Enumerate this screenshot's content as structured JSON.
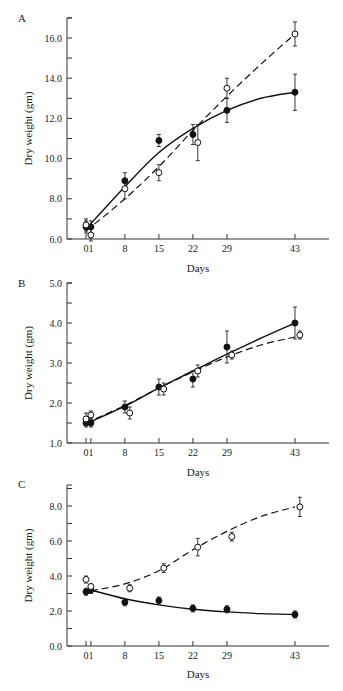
{
  "chart_data": [
    {
      "panel": "A",
      "type": "line",
      "xlabel": "Days",
      "ylabel": "Dry weight (gm)",
      "x_ticks": [
        "0",
        "1",
        "8",
        "15",
        "22",
        "29",
        "43"
      ],
      "y_ticks": [
        "6.0",
        "8.0",
        "10.0",
        "12.0",
        "14.0",
        "16.0"
      ],
      "ylim": [
        6.0,
        17.0
      ],
      "series": [
        {
          "name": "filled",
          "marker": "filled-circle",
          "line": "solid",
          "x": [
            0,
            1,
            8,
            15,
            22,
            29,
            43
          ],
          "y": [
            6.6,
            6.6,
            8.9,
            10.9,
            11.2,
            12.4,
            13.3
          ],
          "err": [
            0.3,
            0.3,
            0.4,
            0.3,
            0.5,
            0.6,
            0.9
          ],
          "fit": [
            [
              0,
              6.5
            ],
            [
              8,
              8.6
            ],
            [
              15,
              10.3
            ],
            [
              22,
              11.5
            ],
            [
              29,
              12.4
            ],
            [
              36,
              13.0
            ],
            [
              43,
              13.3
            ]
          ]
        },
        {
          "name": "open",
          "marker": "open-circle",
          "line": "dashed",
          "x": [
            0,
            1,
            8,
            15,
            23,
            29,
            43
          ],
          "y": [
            6.7,
            6.2,
            8.5,
            9.3,
            10.8,
            13.5,
            16.2
          ],
          "err": [
            0.3,
            0.3,
            0.5,
            0.4,
            0.9,
            0.5,
            0.6
          ],
          "fit": [
            [
              0,
              6.4
            ],
            [
              8,
              8.0
            ],
            [
              15,
              9.6
            ],
            [
              22,
              11.4
            ],
            [
              29,
              13.1
            ],
            [
              36,
              14.7
            ],
            [
              43,
              16.2
            ]
          ]
        }
      ]
    },
    {
      "panel": "B",
      "type": "line",
      "xlabel": "Days",
      "ylabel": "Dry weight (gm)",
      "x_ticks": [
        "0",
        "1",
        "8",
        "15",
        "22",
        "29",
        "43"
      ],
      "y_ticks": [
        "1.0",
        "2.0",
        "3.0",
        "4.0",
        "5.0"
      ],
      "ylim": [
        1.0,
        5.0
      ],
      "series": [
        {
          "name": "filled",
          "marker": "filled-circle",
          "line": "solid",
          "x": [
            0,
            1,
            8,
            15,
            22,
            29,
            43
          ],
          "y": [
            1.5,
            1.5,
            1.9,
            2.4,
            2.6,
            3.4,
            4.0
          ],
          "err": [
            0.1,
            0.1,
            0.15,
            0.2,
            0.2,
            0.4,
            0.4
          ],
          "fit": [
            [
              0,
              1.48
            ],
            [
              8,
              1.92
            ],
            [
              15,
              2.38
            ],
            [
              22,
              2.8
            ],
            [
              29,
              3.22
            ],
            [
              36,
              3.62
            ],
            [
              43,
              4.0
            ]
          ]
        },
        {
          "name": "open",
          "marker": "open-circle",
          "line": "dashed",
          "x": [
            0,
            1,
            9,
            16,
            23,
            30,
            44
          ],
          "y": [
            1.6,
            1.7,
            1.75,
            2.35,
            2.8,
            3.2,
            3.7
          ],
          "err": [
            0.15,
            0.1,
            0.15,
            0.15,
            0.15,
            0.1,
            0.1
          ],
          "fit": [
            [
              0,
              1.5
            ],
            [
              8,
              1.94
            ],
            [
              15,
              2.37
            ],
            [
              22,
              2.78
            ],
            [
              29,
              3.15
            ],
            [
              36,
              3.45
            ],
            [
              43,
              3.65
            ]
          ]
        }
      ]
    },
    {
      "panel": "C",
      "type": "line",
      "xlabel": "Days",
      "ylabel": "Dry weight (gm)",
      "x_ticks": [
        "0",
        "1",
        "8",
        "15",
        "22",
        "29",
        "43"
      ],
      "y_ticks": [
        "0.0",
        "2.0",
        "4.0",
        "6.0",
        "8.0"
      ],
      "ylim": [
        0.0,
        9.0
      ],
      "series": [
        {
          "name": "filled",
          "marker": "filled-circle",
          "line": "solid",
          "x": [
            0,
            1,
            8,
            15,
            22,
            29,
            43
          ],
          "y": [
            3.1,
            3.2,
            2.5,
            2.6,
            2.15,
            2.1,
            1.8
          ],
          "err": [
            0.2,
            0.2,
            0.2,
            0.2,
            0.2,
            0.2,
            0.2
          ],
          "fit": [
            [
              1,
              3.2
            ],
            [
              8,
              2.7
            ],
            [
              15,
              2.35
            ],
            [
              22,
              2.1
            ],
            [
              29,
              1.95
            ],
            [
              36,
              1.85
            ],
            [
              43,
              1.8
            ]
          ]
        },
        {
          "name": "open",
          "marker": "open-circle",
          "line": "dashed",
          "x": [
            0,
            1,
            9,
            16,
            23,
            30,
            44
          ],
          "y": [
            3.8,
            3.4,
            3.3,
            4.45,
            5.65,
            6.25,
            7.95
          ],
          "err": [
            0.2,
            0.15,
            0.2,
            0.25,
            0.5,
            0.25,
            0.55
          ],
          "fit": [
            [
              1,
              3.15
            ],
            [
              8,
              3.55
            ],
            [
              15,
              4.3
            ],
            [
              22,
              5.5
            ],
            [
              29,
              6.55
            ],
            [
              36,
              7.4
            ],
            [
              43,
              7.95
            ]
          ]
        }
      ]
    }
  ]
}
